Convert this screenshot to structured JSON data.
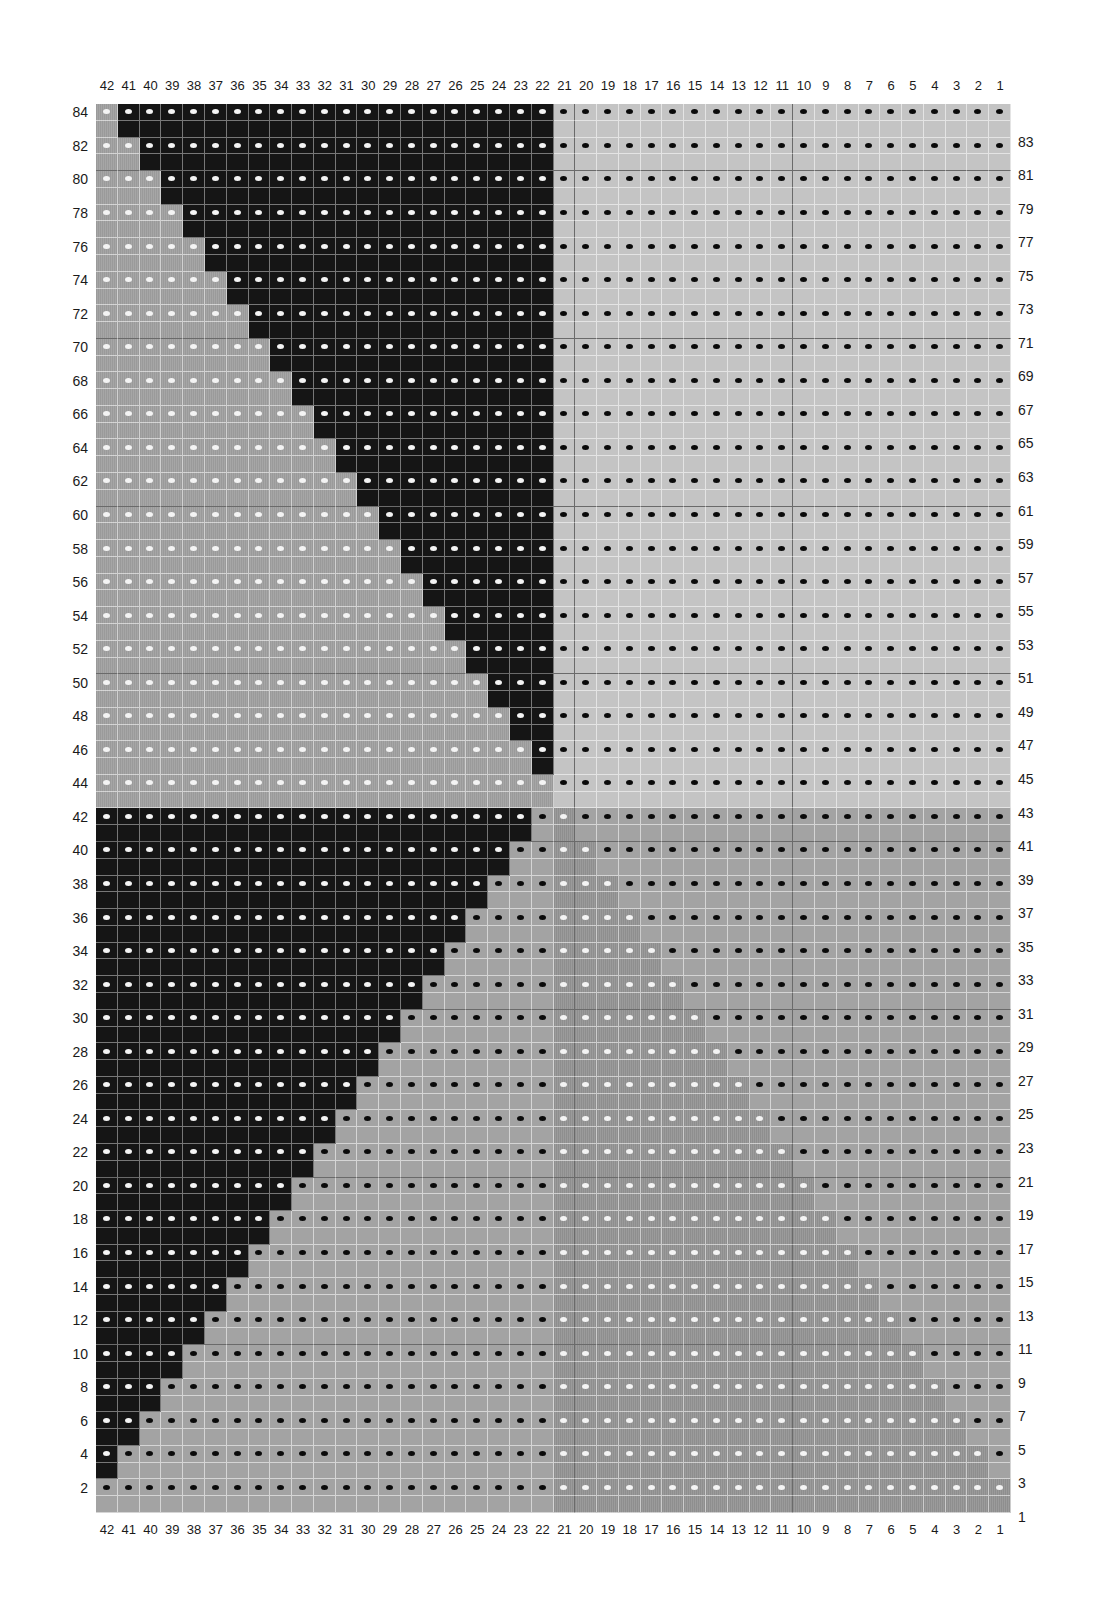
{
  "chart": {
    "title": "",
    "columns": 42,
    "rows": 84,
    "legend_codes": {
      "B": "black (white dot on even rows)",
      "G": "mid-gray striped (white dot on even rows)",
      "L": "light gray (black dot on even rows)",
      "M": "mid-gray plain (black dot on even rows)",
      "S": "mid-gray striped (white dot on even rows)"
    },
    "colors": {
      "B": "#151515",
      "G": "#a0a0a0",
      "L": "#c4c4c4",
      "M": "#a3a3a3",
      "S": "#949494",
      "dot_white": "#f4f4f4",
      "dot_black": "#0a0a0a"
    },
    "column_labels": [
      "42",
      "41",
      "40",
      "39",
      "38",
      "37",
      "36",
      "35",
      "34",
      "33",
      "32",
      "31",
      "30",
      "29",
      "28",
      "27",
      "26",
      "25",
      "24",
      "23",
      "22",
      "21",
      "20",
      "19",
      "18",
      "17",
      "16",
      "15",
      "14",
      "13",
      "12",
      "11",
      "10",
      "9",
      "8",
      "7",
      "6",
      "5",
      "4",
      "3",
      "2",
      "1"
    ],
    "left_row_labels": [
      "84",
      "82",
      "80",
      "78",
      "76",
      "74",
      "72",
      "70",
      "68",
      "66",
      "64",
      "62",
      "60",
      "58",
      "56",
      "54",
      "52",
      "50",
      "48",
      "46",
      "44",
      "42",
      "40",
      "38",
      "36",
      "34",
      "32",
      "30",
      "28",
      "26",
      "24",
      "22",
      "20",
      "18",
      "16",
      "14",
      "12",
      "10",
      "8",
      "6",
      "4",
      "2"
    ],
    "right_row_labels": [
      "83",
      "81",
      "79",
      "77",
      "75",
      "73",
      "71",
      "69",
      "67",
      "65",
      "63",
      "61",
      "59",
      "57",
      "55",
      "53",
      "51",
      "49",
      "47",
      "45",
      "43",
      "41",
      "39",
      "37",
      "35",
      "33",
      "31",
      "29",
      "27",
      "25",
      "23",
      "21",
      "19",
      "17",
      "15",
      "13",
      "11",
      "9",
      "7",
      "5",
      "3",
      "1"
    ],
    "grid_rows": [
      {
        "row": 84,
        "cells": "GBBBBBBBBBBBBBBBBBBBBLLLLLLLLLLLLLLLLLLLLL"
      },
      {
        "row": 83,
        "cells": "GBBBBBBBBBBBBBBBBBBBBLLLLLLLLLLLLLLLLLLLLL"
      },
      {
        "row": 82,
        "cells": "GGBBBBBBBBBBBBBBBBBBBLLLLLLLLLLLLLLLLLLLLL"
      },
      {
        "row": 81,
        "cells": "GGBBBBBBBBBBBBBBBBBBBLLLLLLLLLLLLLLLLLLLLL"
      },
      {
        "row": 80,
        "cells": "GGGBBBBBBBBBBBBBBBBBBLLLLLLLLLLLLLLLLLLLLL"
      },
      {
        "row": 79,
        "cells": "GGGBBBBBBBBBBBBBBBBBBLLLLLLLLLLLLLLLLLLLLL"
      },
      {
        "row": 78,
        "cells": "GGGGBBBBBBBBBBBBBBBBBLLLLLLLLLLLLLLLLLLLLL"
      },
      {
        "row": 77,
        "cells": "GGGGBBBBBBBBBBBBBBBBBLLLLLLLLLLLLLLLLLLLLL"
      },
      {
        "row": 76,
        "cells": "GGGGGBBBBBBBBBBBBBBBBLLLLLLLLLLLLLLLLLLLLL"
      },
      {
        "row": 75,
        "cells": "GGGGGBBBBBBBBBBBBBBBBLLLLLLLLLLLLLLLLLLLLL"
      },
      {
        "row": 74,
        "cells": "GGGGGGBBBBBBBBBBBBBBBLLLLLLLLLLLLLLLLLLLLL"
      },
      {
        "row": 73,
        "cells": "GGGGGGBBBBBBBBBBBBBBBLLLLLLLLLLLLLLLLLLLLL"
      },
      {
        "row": 72,
        "cells": "GGGGGGGBBBBBBBBBBBBBBLLLLLLLLLLLLLLLLLLLLL"
      },
      {
        "row": 71,
        "cells": "GGGGGGGBBBBBBBBBBBBBBLLLLLLLLLLLLLLLLLLLLL"
      },
      {
        "row": 70,
        "cells": "GGGGGGGGBBBBBBBBBBBBBLLLLLLLLLLLLLLLLLLLLL"
      },
      {
        "row": 69,
        "cells": "GGGGGGGGBBBBBBBBBBBBBLLLLLLLLLLLLLLLLLLLLL"
      },
      {
        "row": 68,
        "cells": "GGGGGGGGGBBBBBBBBBBBBLLLLLLLLLLLLLLLLLLLLL"
      },
      {
        "row": 67,
        "cells": "GGGGGGGGGBBBBBBBBBBBBLLLLLLLLLLLLLLLLLLLLL"
      },
      {
        "row": 66,
        "cells": "GGGGGGGGGGBBBBBBBBBBBLLLLLLLLLLLLLLLLLLLLL"
      },
      {
        "row": 65,
        "cells": "GGGGGGGGGGBBBBBBBBBBBLLLLLLLLLLLLLLLLLLLLL"
      },
      {
        "row": 64,
        "cells": "GGGGGGGGGGGBBBBBBBBBBLLLLLLLLLLLLLLLLLLLLL"
      },
      {
        "row": 63,
        "cells": "GGGGGGGGGGGBBBBBBBBBBLLLLLLLLLLLLLLLLLLLLL"
      },
      {
        "row": 62,
        "cells": "GGGGGGGGGGGGBBBBBBBBBLLLLLLLLLLLLLLLLLLLLL"
      },
      {
        "row": 61,
        "cells": "GGGGGGGGGGGGBBBBBBBBBLLLLLLLLLLLLLLLLLLLLL"
      },
      {
        "row": 60,
        "cells": "GGGGGGGGGGGGGBBBBBBBBLLLLLLLLLLLLLLLLLLLLL"
      },
      {
        "row": 59,
        "cells": "GGGGGGGGGGGGGBBBBBBBBLLLLLLLLLLLLLLLLLLLLL"
      },
      {
        "row": 58,
        "cells": "GGGGGGGGGGGGGGBBBBBBBLLLLLLLLLLLLLLLLLLLLL"
      },
      {
        "row": 57,
        "cells": "GGGGGGGGGGGGGGBBBBBBBLLLLLLLLLLLLLLLLLLLLL"
      },
      {
        "row": 56,
        "cells": "GGGGGGGGGGGGGGGBBBBBBLLLLLLLLLLLLLLLLLLLLL"
      },
      {
        "row": 55,
        "cells": "GGGGGGGGGGGGGGGBBBBBBLLLLLLLLLLLLLLLLLLLLL"
      },
      {
        "row": 54,
        "cells": "GGGGGGGGGGGGGGGGBBBBBLLLLLLLLLLLLLLLLLLLLL"
      },
      {
        "row": 53,
        "cells": "GGGGGGGGGGGGGGGGBBBBBLLLLLLLLLLLLLLLLLLLLL"
      },
      {
        "row": 52,
        "cells": "GGGGGGGGGGGGGGGGGBBBBLLLLLLLLLLLLLLLLLLLLL"
      },
      {
        "row": 51,
        "cells": "GGGGGGGGGGGGGGGGGBBBBLLLLLLLLLLLLLLLLLLLLL"
      },
      {
        "row": 50,
        "cells": "GGGGGGGGGGGGGGGGGGBBBLLLLLLLLLLLLLLLLLLLLL"
      },
      {
        "row": 49,
        "cells": "GGGGGGGGGGGGGGGGGGBBBLLLLLLLLLLLLLLLLLLLLL"
      },
      {
        "row": 48,
        "cells": "GGGGGGGGGGGGGGGGGGGBBLLLLLLLLLLLLLLLLLLLLL"
      },
      {
        "row": 47,
        "cells": "GGGGGGGGGGGGGGGGGGGBBLLLLLLLLLLLLLLLLLLLLL"
      },
      {
        "row": 46,
        "cells": "GGGGGGGGGGGGGGGGGGGGBLLLLLLLLLLLLLLLLLLLLL"
      },
      {
        "row": 45,
        "cells": "GGGGGGGGGGGGGGGGGGGGBLLLLLLLLLLLLLLLLLLLLL"
      },
      {
        "row": 44,
        "cells": "GGGGGGGGGGGGGGGGGGGGGLLLLLLLLLLLLLLLLLLLLL"
      },
      {
        "row": 43,
        "cells": "GGGGGGGGGGGGGGGGGGGGGLLLLLLLLLLLLLLLLLLLLL"
      },
      {
        "row": 42,
        "cells": "BBBBBBBBBBBBBBBBBBBBMSMMMMMMMMMMMMMMMMMMMM"
      },
      {
        "row": 41,
        "cells": "BBBBBBBBBBBBBBBBBBBBMSMMMMMMMMMMMMMMMMMMMM"
      },
      {
        "row": 40,
        "cells": "BBBBBBBBBBBBBBBBBBBMMSSMMMMMMMMMMMMMMMMMMM"
      },
      {
        "row": 39,
        "cells": "BBBBBBBBBBBBBBBBBBBMMSSMMMMMMMMMMMMMMMMMMM"
      },
      {
        "row": 38,
        "cells": "BBBBBBBBBBBBBBBBBBMMMSSSMMMMMMMMMMMMMMMMMM"
      },
      {
        "row": 37,
        "cells": "BBBBBBBBBBBBBBBBBBMMMSSSMMMMMMMMMMMMMMMMMM"
      },
      {
        "row": 36,
        "cells": "BBBBBBBBBBBBBBBBBMMMMSSSSMMMMMMMMMMMMMMMMM"
      },
      {
        "row": 35,
        "cells": "BBBBBBBBBBBBBBBBBMMMMSSSSMMMMMMMMMMMMMMMMM"
      },
      {
        "row": 34,
        "cells": "BBBBBBBBBBBBBBBBMMMMMSSSSSMMMMMMMMMMMMMMMM"
      },
      {
        "row": 33,
        "cells": "BBBBBBBBBBBBBBBBMMMMMSSSSSMMMMMMMMMMMMMMMM"
      },
      {
        "row": 32,
        "cells": "BBBBBBBBBBBBBBBMMMMMMSSSSSSMMMMMMMMMMMMMMM"
      },
      {
        "row": 31,
        "cells": "BBBBBBBBBBBBBBBMMMMMMSSSSSSMMMMMMMMMMMMMMM"
      },
      {
        "row": 30,
        "cells": "BBBBBBBBBBBBBBMMMMMMMSSSSSSSMMMMMMMMMMMMMM"
      },
      {
        "row": 29,
        "cells": "BBBBBBBBBBBBBBMMMMMMMSSSSSSSMMMMMMMMMMMMMM"
      },
      {
        "row": 28,
        "cells": "BBBBBBBBBBBBBMMMMMMMMSSSSSSSSMMMMMMMMMMMMM"
      },
      {
        "row": 27,
        "cells": "BBBBBBBBBBBBBMMMMMMMMSSSSSSSSMMMMMMMMMMMMM"
      },
      {
        "row": 26,
        "cells": "BBBBBBBBBBBBMMMMMMMMMSSSSSSSSSMMMMMMMMMMMM"
      },
      {
        "row": 25,
        "cells": "BBBBBBBBBBBBMMMMMMMMMSSSSSSSSSMMMMMMMMMMMM"
      },
      {
        "row": 24,
        "cells": "BBBBBBBBBBBMMMMMMMMMMSSSSSSSSSSMMMMMMMMMMM"
      },
      {
        "row": 23,
        "cells": "BBBBBBBBBBBMMMMMMMMMMSSSSSSSSSSMMMMMMMMMMM"
      },
      {
        "row": 22,
        "cells": "BBBBBBBBBBMMMMMMMMMMMSSSSSSSSSSSMMMMMMMMMM"
      },
      {
        "row": 21,
        "cells": "BBBBBBBBBBMMMMMMMMMMMSSSSSSSSSSSMMMMMMMMMM"
      },
      {
        "row": 20,
        "cells": "BBBBBBBBBMMMMMMMMMMMMSSSSSSSSSSSSMMMMMMMMM"
      },
      {
        "row": 19,
        "cells": "BBBBBBBBBMMMMMMMMMMMMSSSSSSSSSSSSMMMMMMMMM"
      },
      {
        "row": 18,
        "cells": "BBBBBBBBMMMMMMMMMMMMMSSSSSSSSSSSSSMMMMMMMM"
      },
      {
        "row": 17,
        "cells": "BBBBBBBBMMMMMMMMMMMMMSSSSSSSSSSSSSMMMMMMMM"
      },
      {
        "row": 16,
        "cells": "BBBBBBBMMMMMMMMMMMMMMSSSSSSSSSSSSSSMMMMMMM"
      },
      {
        "row": 15,
        "cells": "BBBBBBBMMMMMMMMMMMMMMSSSSSSSSSSSSSSMMMMMMM"
      },
      {
        "row": 14,
        "cells": "BBBBBBMMMMMMMMMMMMMMMSSSSSSSSSSSSSSSMMMMMM"
      },
      {
        "row": 13,
        "cells": "BBBBBBMMMMMMMMMMMMMMMSSSSSSSSSSSSSSSMMMMMM"
      },
      {
        "row": 12,
        "cells": "BBBBBMMMMMMMMMMMMMMMMSSSSSSSSSSSSSSSSMMMMM"
      },
      {
        "row": 11,
        "cells": "BBBBBMMMMMMMMMMMMMMMMSSSSSSSSSSSSSSSSMMMMM"
      },
      {
        "row": 10,
        "cells": "BBBBMMMMMMMMMMMMMMMMMSSSSSSSSSSSSSSSSSMMMM"
      },
      {
        "row": 9,
        "cells": "BBBBMMMMMMMMMMMMMMMMMSSSSSSSSSSSSSSSSSMMMM"
      },
      {
        "row": 8,
        "cells": "BBBMMMMMMMMMMMMMMMMMMSSSSSSSSSSSSSSSSSSMMM"
      },
      {
        "row": 7,
        "cells": "BBBMMMMMMMMMMMMMMMMMMSSSSSSSSSSSSSSSSSSMMM"
      },
      {
        "row": 6,
        "cells": "BBMMMMMMMMMMMMMMMMMMMSSSSSSSSSSSSSSSSSSSMM"
      },
      {
        "row": 5,
        "cells": "BBMMMMMMMMMMMMMMMMMMMSSSSSSSSSSSSSSSSSSSMM"
      },
      {
        "row": 4,
        "cells": "BMMMMMMMMMMMMMMMMMMMMSSSSSSSSSSSSSSSSSSSSM"
      },
      {
        "row": 3,
        "cells": "BMMMMMMMMMMMMMMMMMMMMSSSSSSSSSSSSSSSSSSSSM"
      },
      {
        "row": 2,
        "cells": "MMMMMMMMMMMMMMMMMMMMMSSSSSSSSSSSSSSSSSSSSS"
      },
      {
        "row": 1,
        "cells": "MMMMMMMMMMMMMMMMMMMMMSSSSSSSSSSSSSSSSSSSSS"
      }
    ]
  }
}
